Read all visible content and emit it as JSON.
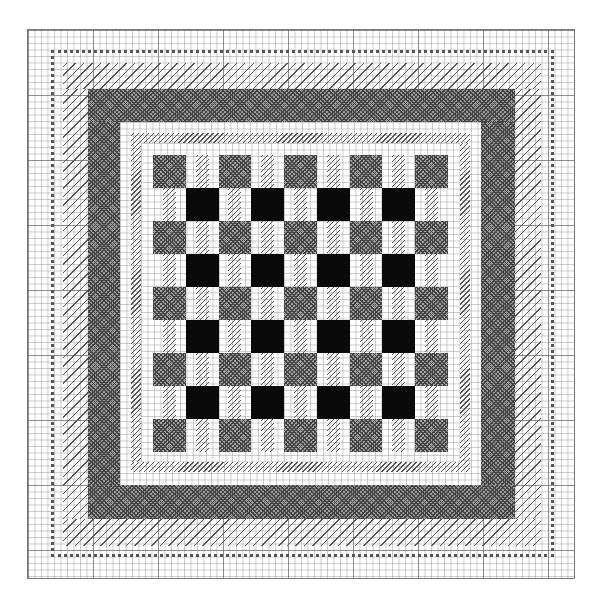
{
  "pattern": {
    "title": "",
    "grid": {
      "columns": 84,
      "rows": 84,
      "major_every": 10
    },
    "borders": [
      {
        "name": "outer-grid-margin",
        "stitch": "blank"
      },
      {
        "name": "loop-border",
        "stitch": "french-knot / loop"
      },
      {
        "name": "sparse-diagonal-border",
        "stitch": "sparse diagonal"
      },
      {
        "name": "dense-crosshatch-border",
        "stitch": "cross-hatch",
        "color": "#9a9a9a"
      },
      {
        "name": "white-gap",
        "stitch": "blank"
      },
      {
        "name": "fine-diagonal-border",
        "stitch": "fine diagonal"
      },
      {
        "name": "white-gap-inner",
        "stitch": "blank"
      }
    ],
    "center": {
      "type": "checkerboard",
      "rows": 9,
      "columns": 9,
      "legend": {
        "gray": "cross-hatched square",
        "black": "solid filled square",
        "stripe": "fine diagonal stripe"
      },
      "colors": {
        "gray": "#a3a3a3",
        "black": "#0a0a0a",
        "line": "#555555"
      },
      "layout": [
        [
          "gray",
          "stripe",
          "gray",
          "stripe",
          "gray",
          "stripe",
          "gray",
          "stripe",
          "gray"
        ],
        [
          "stripe",
          "black",
          "stripe",
          "black",
          "stripe",
          "black",
          "stripe",
          "black",
          "stripe"
        ],
        [
          "gray",
          "stripe",
          "gray",
          "stripe",
          "gray",
          "stripe",
          "gray",
          "stripe",
          "gray"
        ],
        [
          "stripe",
          "black",
          "stripe",
          "black",
          "stripe",
          "black",
          "stripe",
          "black",
          "stripe"
        ],
        [
          "gray",
          "stripe",
          "gray",
          "stripe",
          "gray",
          "stripe",
          "gray",
          "stripe",
          "gray"
        ],
        [
          "stripe",
          "black",
          "stripe",
          "black",
          "stripe",
          "black",
          "stripe",
          "black",
          "stripe"
        ],
        [
          "gray",
          "stripe",
          "gray",
          "stripe",
          "gray",
          "stripe",
          "gray",
          "stripe",
          "gray"
        ],
        [
          "stripe",
          "black",
          "stripe",
          "black",
          "stripe",
          "black",
          "stripe",
          "black",
          "stripe"
        ],
        [
          "gray",
          "stripe",
          "gray",
          "stripe",
          "gray",
          "stripe",
          "gray",
          "stripe",
          "gray"
        ]
      ],
      "counts": {
        "gray_squares": 25,
        "black_squares": 16
      }
    }
  }
}
